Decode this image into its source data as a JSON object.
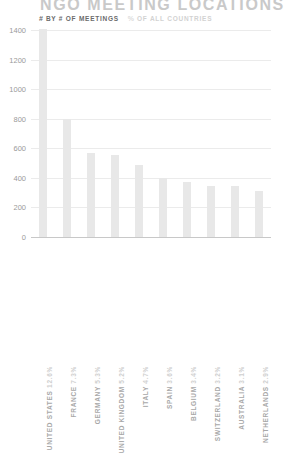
{
  "chart_data": {
    "type": "bar",
    "title": "NGO MEETING LOCATIONS",
    "xlabel": "",
    "ylabel": "",
    "ylim": [
      0,
      1400
    ],
    "yticks": [
      0,
      200,
      400,
      600,
      800,
      1000,
      1200,
      1400
    ],
    "grid": true,
    "legend_position": "top-left",
    "legend": [
      {
        "label": "BY # OF MEETINGS",
        "marker": "#",
        "state": "active"
      },
      {
        "label": "OF ALL COUNTRIES",
        "marker": "%",
        "state": "inactive"
      }
    ],
    "categories": [
      "UNITED STATES",
      "FRANCE",
      "GERMANY",
      "UNITED KINGDOM",
      "ITALY",
      "SPAIN",
      "BELGIUM",
      "SWITZERLAND",
      "AUSTRALIA",
      "NETHERLANDS"
    ],
    "values": [
      1410,
      800,
      570,
      555,
      490,
      400,
      375,
      345,
      345,
      310
    ],
    "percent_labels": [
      "12.6%",
      "7.3%",
      "5.3%",
      "5.2%",
      "4.7%",
      "3.6%",
      "3.4%",
      "3.2%",
      "3.1%",
      "2.9%"
    ],
    "bars": [
      {
        "category": "UNITED STATES",
        "value": 1410,
        "percent": "12.6%"
      },
      {
        "category": "FRANCE",
        "value": 800,
        "percent": "7.3%"
      },
      {
        "category": "GERMANY",
        "value": 570,
        "percent": "5.3%"
      },
      {
        "category": "UNITED KINGDOM",
        "value": 555,
        "percent": "5.2%"
      },
      {
        "category": "ITALY",
        "value": 490,
        "percent": "4.7%"
      },
      {
        "category": "SPAIN",
        "value": 400,
        "percent": "3.6%"
      },
      {
        "category": "BELGIUM",
        "value": 375,
        "percent": "3.4%"
      },
      {
        "category": "SWITZERLAND",
        "value": 345,
        "percent": "3.2%"
      },
      {
        "category": "AUSTRALIA",
        "value": 345,
        "percent": "3.1%"
      },
      {
        "category": "NETHERLANDS",
        "value": 310,
        "percent": "2.9%"
      }
    ],
    "colors": {
      "bar": "#e8e8e8",
      "grid": "#ebebeb",
      "axis": "#c8c8c8",
      "title": "#c9c9c9",
      "legend_active": "#6b6b6b",
      "legend_inactive": "#d2d2d2",
      "tick_text": "#9a9a9a",
      "category_text": "#a8a8a8",
      "percent_text": "#cfcfcf"
    }
  }
}
